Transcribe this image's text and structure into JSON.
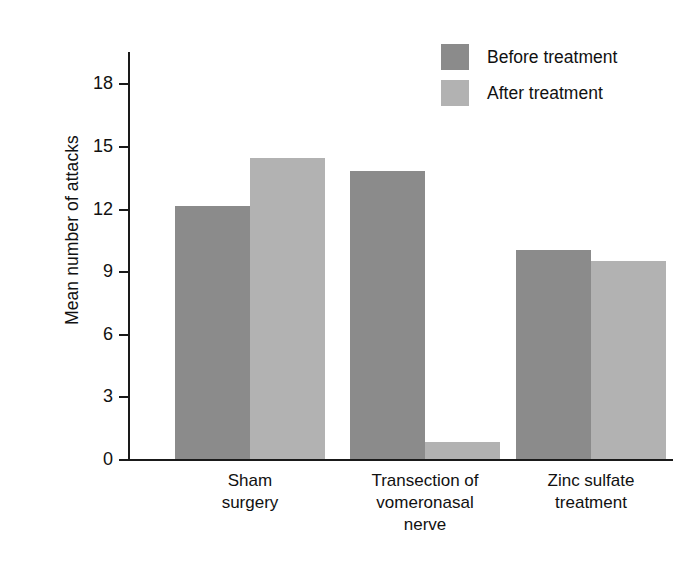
{
  "chart_data": {
    "type": "bar",
    "title": "",
    "xlabel": "",
    "ylabel": "Mean number of attacks",
    "categories": [
      "Sham\nsurgery",
      "Transection of\nvomeronasal\nnerve",
      "Zinc sulfate\ntreatment"
    ],
    "series": [
      {
        "name": "Before treatment",
        "color": "#8b8b8b",
        "values": [
          12.1,
          13.8,
          10.0
        ]
      },
      {
        "name": "After treatment",
        "color": "#b2b2b2",
        "values": [
          14.4,
          0.8,
          9.5
        ]
      }
    ],
    "ylim": [
      0,
      19.5
    ],
    "yticks": [
      0,
      3,
      6,
      9,
      12,
      15,
      18
    ],
    "ytick_labels": [
      "0",
      "3",
      "6",
      "9",
      "12",
      "15",
      "18"
    ],
    "grid": false,
    "legend_position": "top-right"
  },
  "legend": {
    "items": [
      {
        "label": "Before treatment",
        "swatch": "legend-swatch-before"
      },
      {
        "label": "After treatment",
        "swatch": "legend-swatch-after"
      }
    ]
  },
  "axes": {
    "y_label": "Mean number of attacks"
  },
  "colors": {
    "before": "#8b8b8b",
    "after": "#b2b2b2",
    "axis": "#1a1a1a",
    "background": "#ffffff"
  }
}
